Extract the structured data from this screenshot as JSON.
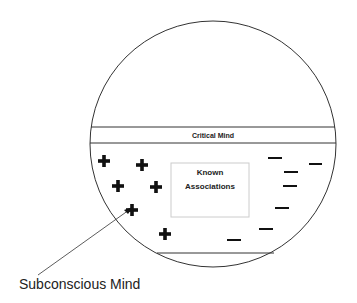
{
  "diagram": {
    "critical_label": "Critical Mind",
    "box_line1": "Known",
    "box_line2": "Associations",
    "caption": "Subconscious Mind",
    "plus_symbol": "+",
    "minus_symbol": "—"
  }
}
